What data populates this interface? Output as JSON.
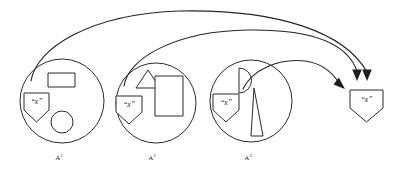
{
  "figure": {
    "type": "diagram",
    "title": "",
    "background_color": "#ffffff",
    "stroke_color": "#2b2b2b",
    "width": 403,
    "height": 172
  },
  "sets": [
    {
      "id": "set-1",
      "label_base": "A",
      "label_exponent": "1",
      "label_full": "A1",
      "center_x": 62,
      "center_y": 101,
      "radius": 42,
      "contents": [
        {
          "name": "node-x",
          "shape": "pentagon",
          "label": "“x”"
        },
        {
          "name": "rectangle",
          "shape": "rectangle",
          "label": ""
        },
        {
          "name": "circle",
          "shape": "circle",
          "label": ""
        }
      ]
    },
    {
      "id": "set-2",
      "label_base": "A",
      "label_exponent": "2",
      "label_full": "A2",
      "center_x": 156,
      "center_y": 103,
      "radius": 40,
      "contents": [
        {
          "name": "node-x",
          "shape": "pentagon",
          "label": "“x”"
        },
        {
          "name": "triangle",
          "shape": "triangle",
          "label": ""
        },
        {
          "name": "rectangle",
          "shape": "rectangle",
          "label": ""
        }
      ]
    },
    {
      "id": "set-3",
      "label_base": "A",
      "label_exponent": "3",
      "label_full": "A3",
      "center_x": 251,
      "center_y": 101,
      "radius": 41,
      "contents": [
        {
          "name": "node-x",
          "shape": "pentagon",
          "label": "“x”"
        },
        {
          "name": "half-circle",
          "shape": "half-circle",
          "label": ""
        },
        {
          "name": "wedge",
          "shape": "narrow-triangle",
          "label": ""
        }
      ]
    }
  ],
  "target": {
    "id": "target-node",
    "name": "target-node-x",
    "shape": "pentagon",
    "label": "“x”",
    "center_x": 366,
    "center_y": 98
  },
  "arrows": [
    {
      "id": "arrow-1",
      "from": "set-1",
      "to": "target-node",
      "style": "curved",
      "head": "filled-triangle",
      "direction": "down"
    },
    {
      "id": "arrow-2",
      "from": "set-2",
      "to": "target-node",
      "style": "curved",
      "head": "filled-triangle",
      "direction": "down"
    },
    {
      "id": "arrow-3",
      "from": "set-3",
      "to": "target-node",
      "style": "curved",
      "head": "filled-triangle",
      "direction": "right-down"
    }
  ]
}
